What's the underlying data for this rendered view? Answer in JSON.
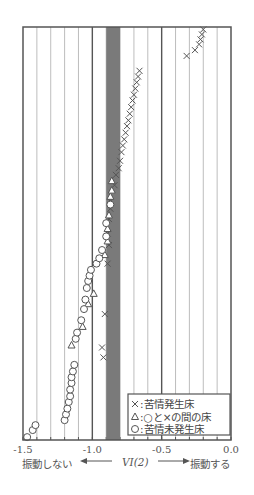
{
  "chart_data": {
    "type": "scatter",
    "title": "",
    "xlabel": "VI(2)",
    "xlabel_left": "振動しない",
    "xlabel_right": "振動する",
    "ylabel": "",
    "xlim": [
      -1.5,
      0.0
    ],
    "x_ticks": [
      -1.5,
      -1.0,
      -0.5,
      0.0
    ],
    "x_tick_labels": [
      "-1.5",
      "-1.0",
      "-0.5",
      "0.0"
    ],
    "minor_grid_step": 0.1,
    "grid": true,
    "shaded_band": {
      "x_from": -0.9,
      "x_to": -0.8,
      "color": "#7a7a7a"
    },
    "y_axis": "cumulative rank (0 = bottom, 1 = top), no tick labels",
    "legend_position": "lower right",
    "legend": [
      {
        "marker": "×",
        "label": "苦情発生床"
      },
      {
        "marker": "△",
        "label": "○と×の間の床"
      },
      {
        "marker": "○",
        "label": "苦情未発生床"
      }
    ],
    "series": [
      {
        "name": "苦情発生床",
        "marker": "x",
        "points": [
          [
            -0.92,
            0.2
          ],
          [
            -0.93,
            0.224
          ],
          [
            -0.91,
            0.305
          ],
          [
            -0.89,
            0.427
          ],
          [
            -0.88,
            0.472
          ],
          [
            -0.89,
            0.5
          ],
          [
            -0.88,
            0.535
          ],
          [
            -0.87,
            0.56
          ],
          [
            -0.87,
            0.578
          ],
          [
            -0.84,
            0.617
          ],
          [
            -0.83,
            0.642
          ],
          [
            -0.81,
            0.658
          ],
          [
            -0.8,
            0.676
          ],
          [
            -0.79,
            0.697
          ],
          [
            -0.78,
            0.713
          ],
          [
            -0.77,
            0.728
          ],
          [
            -0.76,
            0.744
          ],
          [
            -0.75,
            0.76
          ],
          [
            -0.74,
            0.774
          ],
          [
            -0.73,
            0.79
          ],
          [
            -0.72,
            0.806
          ],
          [
            -0.71,
            0.822
          ],
          [
            -0.7,
            0.836
          ],
          [
            -0.69,
            0.851
          ],
          [
            -0.68,
            0.866
          ],
          [
            -0.67,
            0.88
          ],
          [
            -0.66,
            0.894
          ],
          [
            -0.32,
            0.93
          ],
          [
            -0.26,
            0.944
          ],
          [
            -0.23,
            0.958
          ],
          [
            -0.22,
            0.97
          ],
          [
            -0.21,
            0.982
          ],
          [
            -0.2,
            0.994
          ]
        ]
      },
      {
        "name": "○と×の間の床",
        "marker": "triangle",
        "points": [
          [
            -1.15,
            0.23
          ],
          [
            -1.07,
            0.275
          ],
          [
            -1.03,
            0.33
          ],
          [
            -0.99,
            0.355
          ],
          [
            -0.91,
            0.449
          ],
          [
            -0.89,
            0.482
          ],
          [
            -0.89,
            0.512
          ],
          [
            -0.88,
            0.545
          ],
          [
            -0.87,
            0.59
          ],
          [
            -0.86,
            0.605
          ],
          [
            -0.86,
            0.628
          ]
        ]
      },
      {
        "name": "苦情未発生床",
        "marker": "circle",
        "points": [
          [
            -1.47,
            0.007
          ],
          [
            -1.43,
            0.024
          ],
          [
            -1.41,
            0.036
          ],
          [
            -1.2,
            0.048
          ],
          [
            -1.19,
            0.062
          ],
          [
            -1.18,
            0.076
          ],
          [
            -1.17,
            0.092
          ],
          [
            -1.16,
            0.106
          ],
          [
            -1.16,
            0.122
          ],
          [
            -1.15,
            0.138
          ],
          [
            -1.15,
            0.152
          ],
          [
            -1.14,
            0.166
          ],
          [
            -1.13,
            0.182
          ],
          [
            -1.12,
            0.245
          ],
          [
            -1.11,
            0.26
          ],
          [
            -1.08,
            0.29
          ],
          [
            -1.06,
            0.317
          ],
          [
            -1.05,
            0.34
          ],
          [
            -1.04,
            0.368
          ],
          [
            -1.03,
            0.385
          ],
          [
            -1.02,
            0.398
          ],
          [
            -1.01,
            0.412
          ],
          [
            -0.97,
            0.427
          ],
          [
            -0.95,
            0.44
          ],
          [
            -0.93,
            0.46
          ],
          [
            -0.9,
            0.493
          ],
          [
            -0.9,
            0.525
          ],
          [
            -0.87,
            0.57
          ]
        ]
      }
    ]
  },
  "frame": {
    "left": 23,
    "right": 231,
    "top": 27,
    "bottom": 440
  },
  "colors": {
    "axis": "#555555",
    "grid": "#b5b5b5",
    "major_grid": "#555555",
    "band": "#7a7a7a",
    "marker": "#555555"
  }
}
